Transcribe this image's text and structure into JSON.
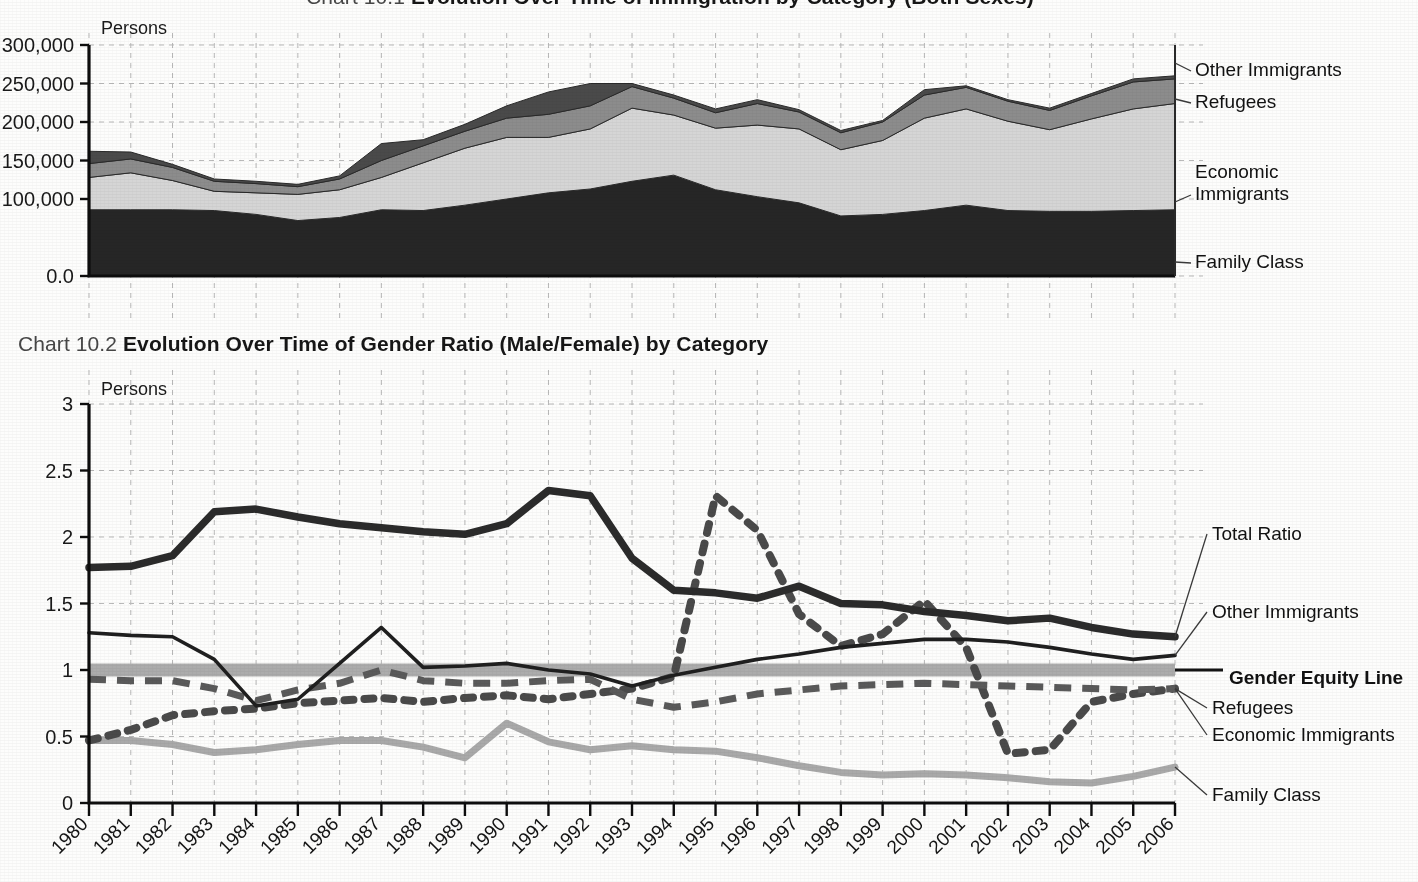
{
  "page": {
    "background_color": "#fdfdfc",
    "ink_color": "#1c1c1c"
  },
  "chart101": {
    "number": "Chart 10.1",
    "title": "Evolution Over Time of Immigration by Category (Both Sexes)",
    "title_clipped": true,
    "y_unit": "Persons",
    "y_ticks": [
      "0.0",
      "100,000",
      "150,000",
      "200,000",
      "250,000",
      "300,000"
    ],
    "series_labels": [
      {
        "name": "Other Immigrants",
        "value_at_label": 250000
      },
      {
        "name": "Refugees",
        "value_at_label": 218000
      },
      {
        "name": "Economic Immigrants",
        "value_at_label": 110000
      },
      {
        "name": "Family Class",
        "value_at_label": 44000
      }
    ],
    "colors": {
      "family_class": "#262626",
      "economic_immigrants": "#d5d5d5",
      "refugees": "#8c8c8c",
      "other_immigrants": "#4a4a4a"
    }
  },
  "chart102": {
    "number": "Chart 10.2",
    "title": "Evolution Over Time of Gender Ratio (Male/Female) by Category",
    "y_unit": "Persons",
    "y_ticks": [
      "0",
      "0.5",
      "1",
      "1.5",
      "2",
      "2.5",
      "3"
    ],
    "series_labels": [
      {
        "name": "Total Ratio",
        "bold": false
      },
      {
        "name": "Other Immigrants",
        "bold": false
      },
      {
        "name": "Gender Equity Line",
        "bold": true
      },
      {
        "name": "Refugees",
        "bold": false
      },
      {
        "name": "Economic Immigrants",
        "bold": false
      },
      {
        "name": "Family Class",
        "bold": false
      }
    ],
    "colors": {
      "total_ratio": "#2b2b2b",
      "other_immigrants": "#1f1f1f",
      "gender_equity_line": "#a8a8a8",
      "refugees": "#4a4a4a",
      "economic_immigrants": "#5a5a5a",
      "family_class": "#a9a9a9"
    }
  },
  "chart_data": [
    {
      "id": "chart-10-1",
      "type": "area",
      "stacked": true,
      "title": "Evolution Over Time of Immigration by Category (Both Sexes)",
      "xlabel": "",
      "ylabel": "Persons",
      "ylim": [
        0,
        300000
      ],
      "yticks": [
        0,
        100000,
        150000,
        200000,
        250000,
        300000
      ],
      "ytick_labels": [
        "0.0",
        "100,000",
        "150,000",
        "200,000",
        "250,000",
        "300,000"
      ],
      "grid": true,
      "legend_position": "right-inline-labels",
      "categories": [
        1980,
        1981,
        1982,
        1983,
        1984,
        1985,
        1986,
        1987,
        1988,
        1989,
        1990,
        1991,
        1992,
        1993,
        1994,
        1995,
        1996,
        1997,
        1998,
        1999,
        2000,
        2001,
        2002,
        2003,
        2004,
        2005,
        2006
      ],
      "series": [
        {
          "name": "Family Class",
          "color": "#262626",
          "values": [
            86000,
            86000,
            86000,
            85000,
            80000,
            72000,
            76000,
            86000,
            85000,
            92000,
            100000,
            108000,
            113000,
            123000,
            131000,
            112000,
            103000,
            95000,
            78000,
            80000,
            85000,
            92000,
            85000,
            84000,
            84000,
            85000,
            86000
          ]
        },
        {
          "name": "Economic Immigrants",
          "color": "#d5d5d5",
          "values": [
            42000,
            48000,
            38000,
            25000,
            28000,
            34000,
            36000,
            42000,
            62000,
            74000,
            80000,
            72000,
            78000,
            95000,
            78000,
            80000,
            93000,
            96000,
            86000,
            96000,
            120000,
            125000,
            116000,
            106000,
            120000,
            132000,
            138000
          ]
        },
        {
          "name": "Refugees",
          "color": "#8c8c8c",
          "values": [
            18000,
            18000,
            17000,
            13000,
            12000,
            10000,
            14000,
            22000,
            22000,
            22000,
            25000,
            30000,
            30000,
            28000,
            22000,
            20000,
            28000,
            22000,
            22000,
            24000,
            30000,
            28000,
            26000,
            25000,
            30000,
            35000,
            32000
          ]
        },
        {
          "name": "Other Immigrants",
          "color": "#4a4a4a",
          "values": [
            16000,
            9000,
            4000,
            3000,
            3000,
            3000,
            4000,
            22000,
            8000,
            9000,
            16000,
            29000,
            29000,
            4000,
            4000,
            5000,
            5000,
            3000,
            3000,
            2000,
            7000,
            2000,
            2000,
            3000,
            3000,
            4000,
            4000
          ]
        }
      ]
    },
    {
      "id": "chart-10-2",
      "type": "line",
      "title": "Evolution Over Time of Gender Ratio (Male/Female) by Category",
      "xlabel": "",
      "ylabel": "Persons",
      "ylim": [
        0,
        3
      ],
      "yticks": [
        0,
        0.5,
        1,
        1.5,
        2,
        2.5,
        3
      ],
      "ytick_labels": [
        "0",
        "0.5",
        "1",
        "1.5",
        "2",
        "2.5",
        "3"
      ],
      "grid": true,
      "legend_position": "right-inline-labels",
      "x": [
        1980,
        1981,
        1982,
        1983,
        1984,
        1985,
        1986,
        1987,
        1988,
        1989,
        1990,
        1991,
        1992,
        1993,
        1994,
        1995,
        1996,
        1997,
        1998,
        1999,
        2000,
        2001,
        2002,
        2003,
        2004,
        2005,
        2006
      ],
      "xtick_labels": [
        "1980",
        "1981",
        "1982",
        "1983",
        "1984",
        "1985",
        "1986",
        "1987",
        "1988",
        "1989",
        "1990",
        "1991",
        "1992",
        "1993",
        "1994",
        "1995",
        "1996",
        "1997",
        "1998",
        "1999",
        "2000",
        "2001",
        "2002",
        "2003",
        "2004",
        "2005",
        "2006"
      ],
      "series": [
        {
          "name": "Total Ratio",
          "style": "solid-thick",
          "color": "#2b2b2b",
          "values": [
            1.77,
            1.78,
            1.86,
            2.19,
            2.21,
            2.15,
            2.1,
            2.07,
            2.04,
            2.02,
            2.1,
            2.35,
            2.31,
            1.84,
            1.6,
            1.58,
            1.54,
            1.63,
            1.5,
            1.49,
            1.44,
            1.41,
            1.37,
            1.39,
            1.32,
            1.27,
            1.25
          ]
        },
        {
          "name": "Other Immigrants",
          "style": "solid-thin",
          "color": "#1f1f1f",
          "values": [
            1.28,
            1.26,
            1.25,
            1.08,
            0.73,
            0.78,
            1.05,
            1.32,
            1.02,
            1.03,
            1.05,
            1.0,
            0.97,
            0.88,
            0.96,
            1.02,
            1.08,
            1.12,
            1.17,
            1.2,
            1.23,
            1.23,
            1.21,
            1.17,
            1.12,
            1.08,
            1.11
          ]
        },
        {
          "name": "Gender Equity Line",
          "style": "band",
          "color": "#a8a8a8",
          "values": [
            1,
            1,
            1,
            1,
            1,
            1,
            1,
            1,
            1,
            1,
            1,
            1,
            1,
            1,
            1,
            1,
            1,
            1,
            1,
            1,
            1,
            1,
            1,
            1,
            1,
            1,
            1
          ]
        },
        {
          "name": "Refugees",
          "style": "dotted",
          "color": "#4a4a4a",
          "values": [
            0.47,
            0.55,
            0.66,
            0.69,
            0.71,
            0.75,
            0.77,
            0.79,
            0.76,
            0.79,
            0.81,
            0.78,
            0.82,
            0.86,
            0.95,
            2.31,
            2.05,
            1.42,
            1.18,
            1.27,
            1.52,
            1.17,
            0.37,
            0.4,
            0.76,
            0.82,
            0.86
          ]
        },
        {
          "name": "Economic Immigrants",
          "style": "dashed",
          "color": "#5a5a5a",
          "values": [
            0.93,
            0.92,
            0.92,
            0.86,
            0.77,
            0.85,
            0.9,
            1.0,
            0.92,
            0.9,
            0.9,
            0.92,
            0.93,
            0.78,
            0.72,
            0.76,
            0.82,
            0.85,
            0.88,
            0.89,
            0.9,
            0.89,
            0.88,
            0.87,
            0.86,
            0.85,
            0.86
          ]
        },
        {
          "name": "Family Class",
          "style": "solid-medium",
          "color": "#a9a9a9",
          "values": [
            0.47,
            0.47,
            0.44,
            0.38,
            0.4,
            0.44,
            0.47,
            0.47,
            0.42,
            0.34,
            0.6,
            0.46,
            0.4,
            0.43,
            0.4,
            0.39,
            0.34,
            0.28,
            0.23,
            0.21,
            0.22,
            0.21,
            0.19,
            0.16,
            0.15,
            0.2,
            0.27
          ]
        }
      ]
    }
  ]
}
